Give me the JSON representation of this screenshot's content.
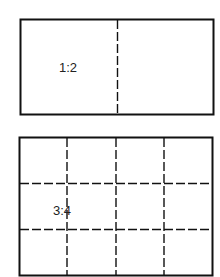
{
  "diagrams": [
    {
      "label": "1:2",
      "rows": 1,
      "cols": 2
    },
    {
      "label": "3:4",
      "rows": 3,
      "cols": 4
    }
  ],
  "colors": {
    "stroke": "#111111",
    "background": "#ffffff"
  }
}
